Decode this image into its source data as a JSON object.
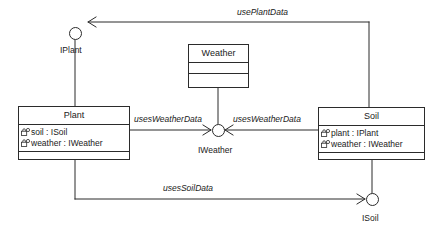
{
  "diagram": {
    "type": "uml-component-diagram",
    "background": "#ffffff",
    "line_color": "#2b2b2b",
    "text_color": "#1a1a1a"
  },
  "classes": [
    {
      "name": "Plant",
      "attributes": [
        {
          "icon": "private-attribute-icon",
          "text": "soil : ISoil"
        },
        {
          "icon": "private-attribute-icon",
          "text": "weather : IWeather"
        }
      ],
      "operations": []
    },
    {
      "name": "Weather",
      "attributes": [],
      "operations": []
    },
    {
      "name": "Soil",
      "attributes": [
        {
          "icon": "private-attribute-icon",
          "text": "plant : IPlant"
        },
        {
          "icon": "private-attribute-icon",
          "text": "weather : IWeather"
        }
      ],
      "operations": []
    }
  ],
  "interfaces": [
    {
      "name": "IPlant",
      "provider": "Plant"
    },
    {
      "name": "IWeather",
      "provider": "Weather"
    },
    {
      "name": "ISoil",
      "provider": "Soil"
    }
  ],
  "connectors": [
    {
      "label": "usePlantData",
      "from": "Soil",
      "to": "IPlant"
    },
    {
      "label": "usesWeatherData",
      "from": "Plant",
      "to": "IWeather"
    },
    {
      "label": "usesWeatherData",
      "from": "Soil",
      "to": "IWeather"
    },
    {
      "label": "usesSoilData",
      "from": "Plant",
      "to": "ISoil"
    }
  ]
}
